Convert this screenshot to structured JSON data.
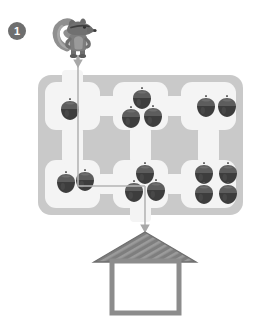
{
  "page": {
    "background_color": "#ffffff",
    "exercise_number": "1"
  },
  "badge": {
    "label": "1",
    "fill_color": "#6e6e6e",
    "text_color": "#ffffff"
  },
  "character": {
    "name": "squirrel",
    "label": "squirrel",
    "body_color": "#7a7a7a",
    "dark_color": "#4a4a4a",
    "tail_color": "#8a8a8a"
  },
  "maze": {
    "name": "acorn-maze",
    "wall_color": "#c9c9c9",
    "room_color": "#f2f2f2",
    "columns": 3,
    "rows": 2
  },
  "destination": {
    "name": "house",
    "label": "house",
    "roof_color": "#808080",
    "roof_stripe_color": "#9a9a9a",
    "wall_color": "#8c8c8c",
    "body_color": "#ffffff"
  },
  "path": {
    "name": "solution-arrow",
    "color": "#b3b3b3",
    "arrowhead_color": "#a6a6a6",
    "description": "down, right, down",
    "segments": [
      {
        "from": [
          78,
          56
        ],
        "to": [
          78,
          186
        ],
        "direction": "down"
      },
      {
        "from": [
          78,
          186
        ],
        "to": [
          145,
          186
        ],
        "direction": "right"
      },
      {
        "from": [
          145,
          186
        ],
        "to": [
          145,
          232
        ],
        "direction": "down"
      }
    ]
  },
  "acorn_groups": [
    {
      "name": "acorn-group-top-left",
      "count": 1,
      "cell": "row1-col1"
    },
    {
      "name": "acorn-group-top-middle",
      "count": 3,
      "cell": "row1-col2"
    },
    {
      "name": "acorn-group-top-right",
      "count": 2,
      "cell": "row1-col3"
    },
    {
      "name": "acorn-group-bottom-left",
      "count": 2,
      "cell": "row2-col1"
    },
    {
      "name": "acorn-group-bottom-middle",
      "count": 3,
      "cell": "row2-col2"
    },
    {
      "name": "acorn-group-bottom-right",
      "count": 4,
      "cell": "row2-col3"
    }
  ],
  "acorn": {
    "label": "acorn",
    "cap_color": "#5a5a5a",
    "body_color": "#3f3f3f",
    "highlight_color": "#6b6b6b"
  },
  "acorn_positions": {
    "top_left": [
      [
        70,
        111
      ]
    ],
    "top_middle": [
      [
        140,
        99
      ],
      [
        130,
        117
      ],
      [
        151,
        117
      ]
    ],
    "top_right": [
      [
        206,
        107
      ],
      [
        226,
        107
      ]
    ],
    "bottom_left": [
      [
        66,
        182
      ],
      [
        85,
        180
      ]
    ],
    "bottom_middle": [
      [
        144,
        173
      ],
      [
        134,
        190
      ],
      [
        155,
        190
      ]
    ],
    "bottom_right": [
      [
        204,
        173
      ],
      [
        228,
        173
      ],
      [
        204,
        192
      ],
      [
        228,
        192
      ]
    ]
  }
}
